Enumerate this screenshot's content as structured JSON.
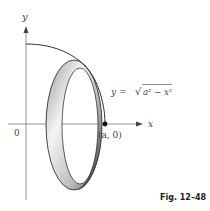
{
  "figure": {
    "caption": "Fig. 12–48",
    "curve_label_lhs": "y = ",
    "curve_label_sqrt": "√",
    "curve_label_radicand": "a² − x²",
    "axis_x_label": "x",
    "axis_y_label": "y",
    "origin_label": "0",
    "point_label": "(a, 0)"
  },
  "colors": {
    "line": "#333333",
    "axis": "#555555",
    "band_dark": "#555555",
    "band_light": "#f0f0f0"
  }
}
